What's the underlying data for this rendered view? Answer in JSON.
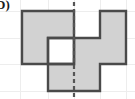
{
  "figure": {
    "label": "D)",
    "title": "Shaded polyomino figure with dashed vertical line of symmetry",
    "colors": {
      "fill": "#d2d2d2",
      "stroke": "#4a4a4a",
      "background": "#ffffff",
      "grid_line": "#ededed",
      "dash_line": "#555555",
      "label_color": "#1b1b1b"
    },
    "grid": {
      "cell_size": 26,
      "origin_x": 22,
      "origin_y": 11,
      "columns": 4,
      "rows": 3,
      "column_edges": [
        22,
        48,
        74,
        100,
        126
      ],
      "row_edges": [
        11,
        38,
        64,
        91
      ]
    },
    "filled_cells": [
      {
        "col": 0,
        "row": 0
      },
      {
        "col": 1,
        "row": 0
      },
      {
        "col": 3,
        "row": 0
      },
      {
        "col": 0,
        "row": 1
      },
      {
        "col": 2,
        "row": 1
      },
      {
        "col": 3,
        "row": 1
      },
      {
        "col": 1,
        "row": 2
      },
      {
        "col": 2,
        "row": 2
      }
    ],
    "empty_cells": [
      {
        "col": 2,
        "row": 0
      },
      {
        "col": 1,
        "row": 1
      },
      {
        "col": 0,
        "row": 2
      },
      {
        "col": 3,
        "row": 2
      }
    ],
    "filled_count": 8,
    "outline_path": "M22,11 L74,11 L74,38 L100,38 L100,11 L126,11 L126,64 L100,64 L100,91 L48,91 L48,64 L22,64 Z",
    "hole_path": "M48,38 L74,38 L74,64 L48,64 Z",
    "symmetry_line": {
      "x": 74,
      "y_start": 2,
      "y_end": 97,
      "style": "dashed",
      "dash_pattern": "4,3",
      "width": 2.2
    },
    "background_grid": {
      "vertical_x": [
        20,
        48,
        74,
        100,
        126
      ],
      "horizontal_y": [
        11,
        38,
        64,
        91
      ]
    }
  }
}
